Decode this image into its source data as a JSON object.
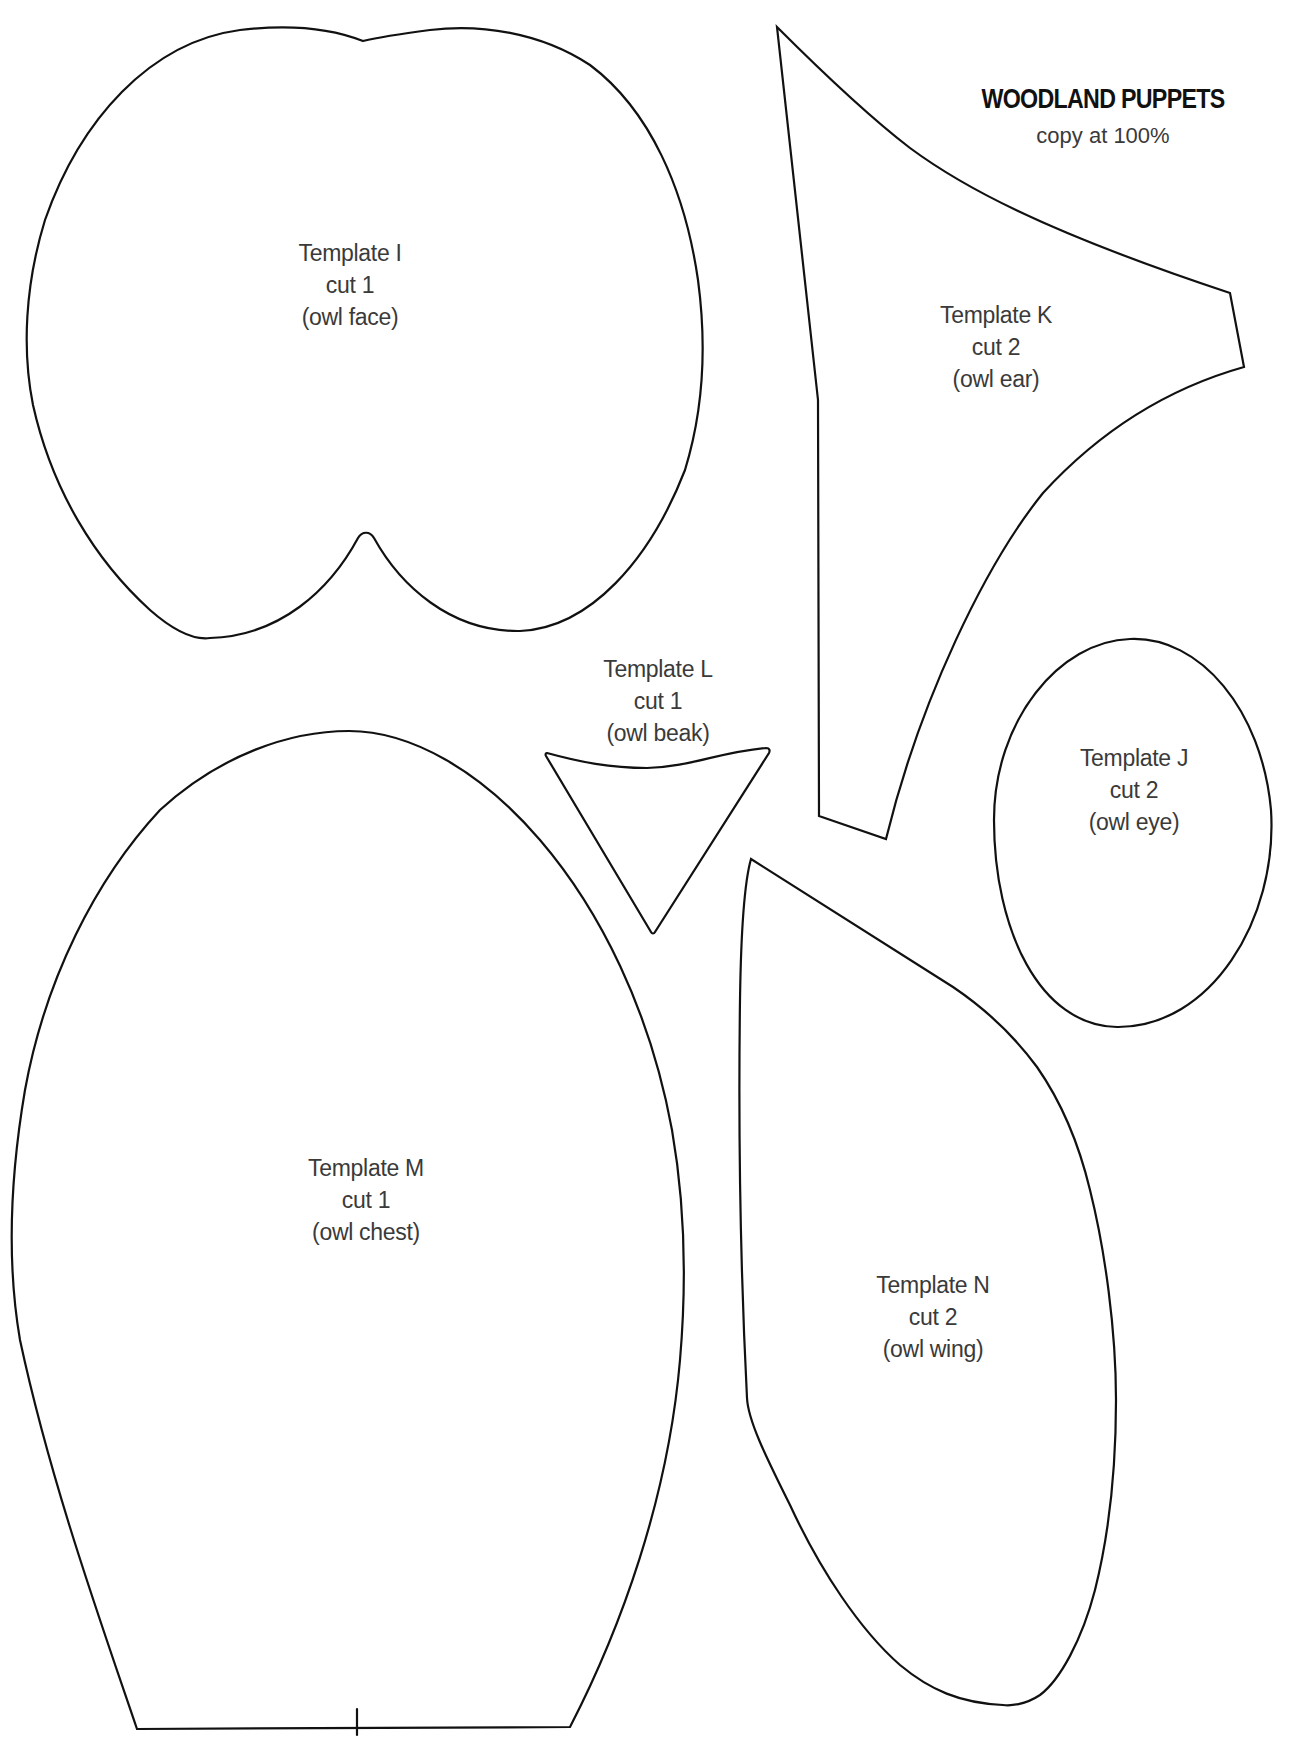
{
  "document": {
    "title": "WOODLAND PUPPETS",
    "subtitle": "copy at 100%"
  },
  "colors": {
    "outline": "#111111",
    "label_text": "#3a3a3a",
    "background": "#ffffff"
  },
  "templates": [
    {
      "id": "I",
      "name": "Template I",
      "cut": "cut 1",
      "part": "(owl face)",
      "path": "M363,41 C330,28 290,24 240,30 C150,42 80,120 45,220 C25,285 22,350 33,405 C52,490 95,560 150,610 C175,632 195,640 210,638 C280,636 330,590 358,538 C362,531 370,531 374,538 C400,585 450,632 520,631 C590,628 650,560 685,470 C705,405 706,340 698,280 C685,190 650,110 590,65 C540,32 480,24 430,30 C400,34 380,37 363,41 Z",
      "label_x": 350,
      "label_y": 237
    },
    {
      "id": "K",
      "name": "Template K",
      "cut": "cut 2",
      "part": "(owl ear)",
      "path": "M777,27 C840,90 880,125 910,148 C960,185 1040,230 1230,293 L1244,367 C1180,385 1110,420 1043,493 C985,565 920,700 886,839 L819,816 L818,400 Z",
      "label_x": 996,
      "label_y": 299
    },
    {
      "id": "J",
      "name": "Template J",
      "cut": "cut 2",
      "part": "(owl eye)",
      "path": "M1130,639 C1200,636 1262,710 1271,810 C1278,920 1210,1028 1117,1027 C1040,1026 994,930 994,820 C994,720 1060,641 1130,639 Z",
      "label_x": 1134,
      "label_y": 742
    },
    {
      "id": "L",
      "name": "Template L",
      "cut": "cut 1",
      "part": "(owl beak)",
      "path": "M547,753 C580,762 610,768 647,768 C690,767 720,752 766,748 C770,748 770,751 769,753 L655,932 C654,934 652,934 651,932 L546,756 C545,754 546,753 547,753 Z",
      "label_x": 658,
      "label_y": 653
    },
    {
      "id": "M",
      "name": "Template M",
      "cut": "cut 1",
      "part": "(owl chest)",
      "path": "M349,731 C410,731 480,770 540,840 C600,910 650,1010 672,1130 C686,1210 686,1290 680,1360 C668,1500 620,1630 570,1727 L137,1729 C100,1620 50,1480 20,1340 C8,1270 8,1190 25,1090 C45,980 95,880 160,810 C220,755 290,731 349,731 Z",
      "label_x": 366,
      "label_y": 1152,
      "tick_mark": "M357,1709 L357,1735"
    },
    {
      "id": "N",
      "name": "Template N",
      "cut": "cut 2",
      "part": "(owl wing)",
      "path": "M751,859 L953,987 C990,1012 1015,1037 1037,1067 C1060,1100 1078,1140 1090,1190 C1105,1250 1116,1330 1116,1400 C1116,1470 1110,1530 1095,1590 C1082,1640 1060,1680 1040,1695 C1025,1705 1010,1706 1003,1705 C960,1703 930,1690 900,1665 C860,1630 820,1570 790,1505 C765,1455 748,1420 747,1398 C742,1300 738,1150 740,1000 C741,930 745,880 751,859 Z",
      "label_x": 933,
      "label_y": 1269
    }
  ]
}
